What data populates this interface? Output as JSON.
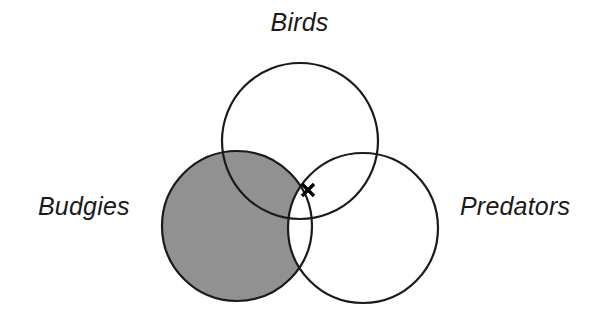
{
  "figure": {
    "type": "venn-diagram",
    "width": 599,
    "height": 323,
    "background_color": "#ffffff",
    "stroke_color": "#1a1a1a",
    "stroke_width": 2,
    "shaded_fill_color": "#919191"
  },
  "labels": {
    "birds": "Birds",
    "budgies": "Budgies",
    "predators": "Predators"
  },
  "marker": {
    "glyph": "x",
    "label": "x-marker",
    "x": 308,
    "y": 190,
    "color": "#000000",
    "region": "Birds and Predators, not Budgies"
  },
  "chart_data": {
    "type": "venn",
    "title": "",
    "sets": [
      {
        "name": "Birds",
        "label": "Birds",
        "cx": 300,
        "cy": 141,
        "r": 78,
        "filled": false,
        "label_position": "top"
      },
      {
        "name": "Budgies",
        "label": "Budgies",
        "cx": 237,
        "cy": 226,
        "r": 75,
        "filled": true,
        "label_position": "left"
      },
      {
        "name": "Predators",
        "label": "Predators",
        "cx": 363,
        "cy": 228,
        "r": 75,
        "filled": false,
        "label_position": "right"
      }
    ],
    "shaded_regions": [
      {
        "id": "budgies-minus-predators",
        "includes": [
          "Budgies"
        ],
        "excludes": [
          "Predators"
        ],
        "fill": "#919191",
        "description": "All of Budgies except the part overlapping Predators; the Budgies-Birds overlap is shaded."
      }
    ],
    "annotations": [
      {
        "text": "x",
        "x": 308,
        "y": 190,
        "in_sets": [
          "Birds",
          "Predators"
        ],
        "not_in_sets": [
          "Budgies"
        ]
      }
    ],
    "legend": "none",
    "grid": false
  }
}
